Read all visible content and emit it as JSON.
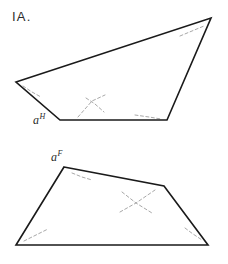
{
  "figure": {
    "problem_number": "IA.",
    "background_color": "#ffffff",
    "solid_line_color": "#1a1a1a",
    "dashed_line_color": "#a8a8a8",
    "solid_line_width": 1.6,
    "dashed_line_width": 1.0,
    "width": 228,
    "height": 264
  },
  "shapes": [
    {
      "name": "top-quadrilateral",
      "label": "a",
      "label_superscript": "H",
      "label_text": "aH",
      "label_position": {
        "x": 33,
        "y": 112
      },
      "vertices": [
        {
          "x": 16,
          "y": 82
        },
        {
          "x": 211,
          "y": 18
        },
        {
          "x": 167,
          "y": 120
        },
        {
          "x": 60,
          "y": 120
        }
      ],
      "vertex_marks": [
        {
          "name": "angle-tick-left",
          "points": "23,86 32,92 41,97"
        },
        {
          "name": "angle-tick-top-right",
          "points": "180,36 192,31 204,26"
        },
        {
          "name": "angle-tick-bottom-right",
          "points": "135,115 149,117 161,119"
        },
        {
          "name": "cross-mark-lower",
          "points": "78,117 92,101 105,95"
        },
        {
          "name": "cross-mark-lower-b",
          "points": "86,98 95,104 104,112"
        }
      ]
    },
    {
      "name": "bottom-quadrilateral",
      "label": "a",
      "label_superscript": "F",
      "label_text": "aF",
      "label_position": {
        "x": 51,
        "y": 149
      },
      "vertices": [
        {
          "x": 64,
          "y": 167
        },
        {
          "x": 164,
          "y": 186
        },
        {
          "x": 208,
          "y": 245
        },
        {
          "x": 16,
          "y": 245
        }
      ],
      "vertex_marks": [
        {
          "name": "angle-tick-top",
          "points": "72,173 82,177 92,180"
        },
        {
          "name": "angle-tick-bottom-left",
          "points": "24,241 36,235 48,229"
        },
        {
          "name": "angle-tick-bottom-right",
          "points": "185,228 193,234 202,240"
        },
        {
          "name": "cross-mark-center",
          "points": "122,192 136,203 152,213"
        },
        {
          "name": "cross-mark-center-b",
          "points": "120,212 136,203 155,190"
        }
      ]
    }
  ]
}
